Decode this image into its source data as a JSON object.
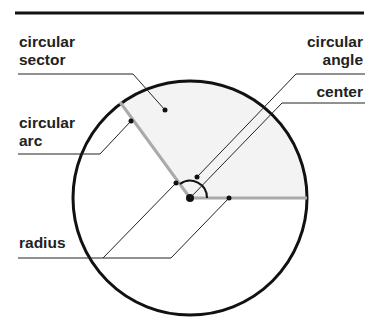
{
  "diagram": {
    "type": "circle-parts",
    "labels": {
      "circular_sector": [
        "circular",
        "sector"
      ],
      "circular_angle": [
        "circular",
        "angle"
      ],
      "center": "center",
      "circular_arc": [
        "circular",
        "arc"
      ],
      "radius": "radius"
    },
    "colors": {
      "outline": "#111111",
      "radius_line": "#aaaaaa",
      "sector_fill": "#f3f3f3",
      "leader": "#222222"
    }
  }
}
